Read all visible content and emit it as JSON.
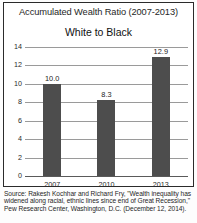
{
  "chart_data": {
    "type": "bar",
    "title": "Accumulated Wealth Ratio (2007-2013)",
    "subtitle": "White to Black",
    "categories": [
      "2007",
      "2010",
      "2013"
    ],
    "values": [
      10.0,
      8.3,
      12.9
    ],
    "value_labels": [
      "10.0",
      "8.3",
      "12.9"
    ],
    "xlabel": "",
    "ylabel": "",
    "ylim": [
      0,
      14
    ],
    "yticks": [
      0,
      2,
      4,
      6,
      8,
      10,
      12,
      14
    ],
    "ytick_labels": [
      "0",
      "2",
      "4",
      "6",
      "8",
      "10",
      "12",
      "14"
    ],
    "grid": true,
    "legend": "none",
    "bar_color": "#4d4d4d",
    "gridline_color": "#9a9a9a",
    "axis_color": "#5a5a5a"
  },
  "source": {
    "line1": "Source: Rakesh Kochhar and Richard Fry, \"Wealth inequality has",
    "line2": "widened along racial, ethnic lines since end of Great Recession,\"",
    "line3": "Pew Research Center, Washington, D.C. (December 12, 2014)."
  }
}
